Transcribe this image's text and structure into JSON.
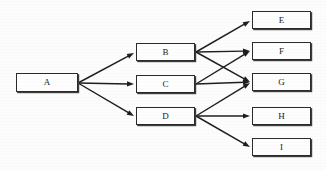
{
  "diagram": {
    "type": "directed-graph",
    "title": "",
    "orientation": "left-to-right",
    "layers": [
      {
        "name": "source",
        "node_ids": [
          "A"
        ]
      },
      {
        "name": "middle",
        "node_ids": [
          "B",
          "C",
          "D"
        ]
      },
      {
        "name": "sink",
        "node_ids": [
          "E",
          "F",
          "G",
          "H",
          "I"
        ]
      }
    ],
    "nodes": [
      {
        "id": "A",
        "label": "A",
        "x": 16,
        "y": 73,
        "w": 62,
        "h": 19
      },
      {
        "id": "B",
        "label": "B",
        "x": 136,
        "y": 43,
        "w": 59,
        "h": 18
      },
      {
        "id": "C",
        "label": "C",
        "x": 136,
        "y": 75,
        "w": 59,
        "h": 18
      },
      {
        "id": "D",
        "label": "D",
        "x": 136,
        "y": 107,
        "w": 59,
        "h": 18
      },
      {
        "id": "E",
        "label": "E",
        "x": 252,
        "y": 11,
        "w": 59,
        "h": 18
      },
      {
        "id": "F",
        "label": "F",
        "x": 252,
        "y": 42,
        "w": 59,
        "h": 18
      },
      {
        "id": "G",
        "label": "G",
        "x": 252,
        "y": 73,
        "w": 59,
        "h": 18
      },
      {
        "id": "H",
        "label": "H",
        "x": 252,
        "y": 107,
        "w": 59,
        "h": 18
      },
      {
        "id": "I",
        "label": "I",
        "x": 252,
        "y": 138,
        "w": 59,
        "h": 18
      }
    ],
    "edges": [
      {
        "from": "A",
        "to": "B",
        "x1": 78,
        "y1": 83,
        "x2": 134,
        "y2": 53
      },
      {
        "from": "A",
        "to": "C",
        "x1": 78,
        "y1": 83,
        "x2": 134,
        "y2": 84
      },
      {
        "from": "A",
        "to": "D",
        "x1": 78,
        "y1": 83,
        "x2": 134,
        "y2": 116
      },
      {
        "from": "B",
        "to": "E",
        "x1": 196,
        "y1": 52,
        "x2": 250,
        "y2": 21
      },
      {
        "from": "B",
        "to": "F",
        "x1": 196,
        "y1": 52,
        "x2": 250,
        "y2": 51
      },
      {
        "from": "B",
        "to": "G",
        "x1": 196,
        "y1": 52,
        "x2": 250,
        "y2": 82
      },
      {
        "from": "C",
        "to": "F",
        "x1": 196,
        "y1": 84,
        "x2": 250,
        "y2": 51
      },
      {
        "from": "C",
        "to": "G",
        "x1": 196,
        "y1": 84,
        "x2": 250,
        "y2": 82
      },
      {
        "from": "D",
        "to": "G",
        "x1": 196,
        "y1": 116,
        "x2": 250,
        "y2": 83
      },
      {
        "from": "D",
        "to": "H",
        "x1": 196,
        "y1": 116,
        "x2": 250,
        "y2": 116
      },
      {
        "from": "D",
        "to": "I",
        "x1": 196,
        "y1": 116,
        "x2": 250,
        "y2": 147
      }
    ],
    "colors": {
      "background": "#fdfdfd",
      "box_fill": "#fefefe",
      "box_border": "#2b2b2b",
      "box_shadow": "#3d3d3d",
      "edge": "#1f1f1f",
      "label_text": "#1a1a1a"
    }
  }
}
